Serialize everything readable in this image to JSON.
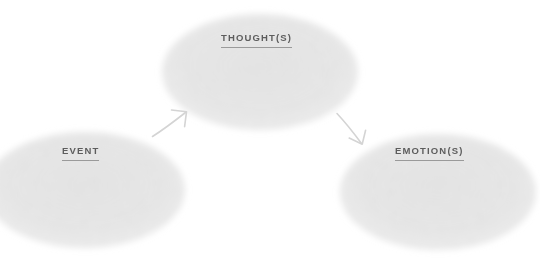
{
  "diagram": {
    "background_color": "#ffffff",
    "label_color": "#5d5d5d",
    "blob_color": "#fafafa",
    "arrow_color": "#d2d2d2",
    "nodes": [
      {
        "id": "event",
        "label": "EVENT",
        "icon": "blob-shape",
        "center_x": 85,
        "center_y": 190,
        "width": 200,
        "height": 115
      },
      {
        "id": "thought",
        "label": "THOUGHT(S)",
        "icon": "blob-shape",
        "center_x": 260,
        "center_y": 72,
        "width": 196,
        "height": 116
      },
      {
        "id": "emotion",
        "label": "EMOTION(S)",
        "icon": "blob-shape",
        "center_x": 438,
        "center_y": 192,
        "width": 196,
        "height": 116
      }
    ],
    "connectors": [
      {
        "id": "event-to-thought",
        "icon": "arrow-up-right-icon",
        "from": "event",
        "to": "thought",
        "direction": "up-right"
      },
      {
        "id": "thought-to-emotion",
        "icon": "arrow-down-right-icon",
        "from": "thought",
        "to": "emotion",
        "direction": "down-right"
      }
    ]
  }
}
